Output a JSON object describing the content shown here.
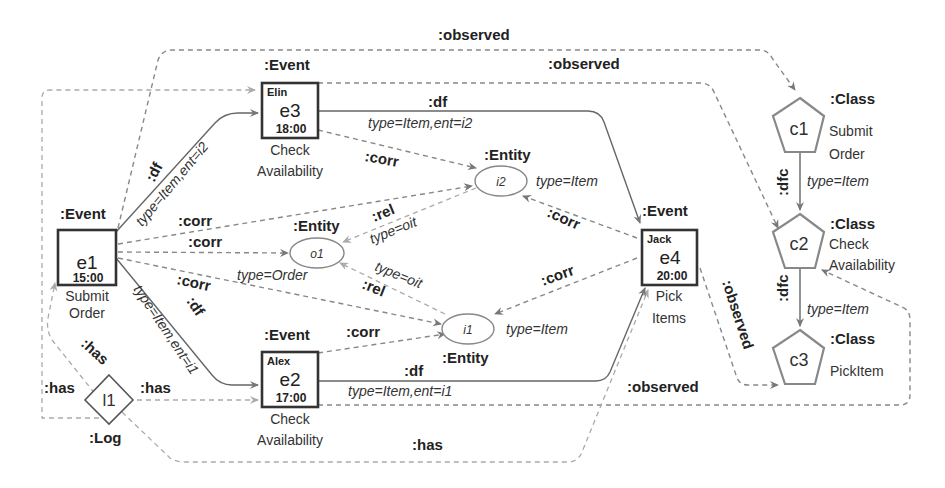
{
  "events": [
    {
      "id": "e1",
      "type": ":Event",
      "actor": "",
      "time": "15:00",
      "activity_line1": "Submit",
      "activity_line2": "Order"
    },
    {
      "id": "e2",
      "type": ":Event",
      "actor": "Alex",
      "time": "17:00",
      "activity_line1": "Check",
      "activity_line2": "Availability"
    },
    {
      "id": "e3",
      "type": ":Event",
      "actor": "Elin",
      "time": "18:00",
      "activity_line1": "Check",
      "activity_line2": "Availability"
    },
    {
      "id": "e4",
      "type": ":Event",
      "actor": "Jack",
      "time": "20:00",
      "activity_line1": "Pick",
      "activity_line2": "Items"
    }
  ],
  "entities": [
    {
      "id": "i2",
      "type": ":Entity",
      "attr": "type=Item"
    },
    {
      "id": "o1",
      "type": ":Entity",
      "attr": "type=Order"
    },
    {
      "id": "i1",
      "type": ":Entity",
      "attr": "type=Item"
    }
  ],
  "classes": [
    {
      "id": "c1",
      "type": ":Class",
      "name_line1": "Submit",
      "name_line2": "Order"
    },
    {
      "id": "c2",
      "type": ":Class",
      "name_line1": "Check",
      "name_line2": "Availability"
    },
    {
      "id": "c3",
      "type": ":Class",
      "name_line1": "PickItem",
      "name_line2": ""
    }
  ],
  "log": {
    "id": "l1",
    "type": ":Log"
  },
  "edges": {
    "observed": ":observed",
    "df": ":df",
    "corr": ":corr",
    "rel": ":rel",
    "has": ":has",
    "dfc": ":dfc",
    "df_e1_e3": "type=Item,ent=i2",
    "df_e1_e2": "type=Item,ent=i1",
    "df_e3_e4": "type=Item,ent=i2",
    "df_e2_e4": "type=Item,ent=i1",
    "rel_i2_o1": "type=oit",
    "rel_i1_o1": "type=oit",
    "dfc_c1_c2": "type=Item",
    "dfc_c2_c3": "type=Item"
  }
}
